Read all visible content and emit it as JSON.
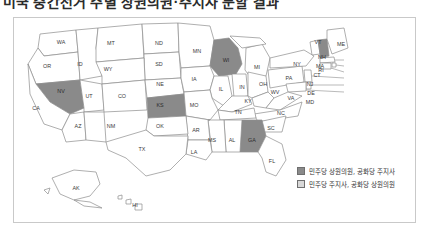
{
  "title": "미국 중간선거 주별 상원의원·주지사 분할 결과",
  "figure": {
    "legend": {
      "items": [
        {
          "label": "민주당 상원의원, 공화당 주지사",
          "swatch": "dark",
          "color": "#8a8a8a"
        },
        {
          "label": "민주당 주지사, 공화당 상원의원",
          "swatch": "light",
          "color": "#d8d8d8"
        }
      ]
    },
    "map": {
      "type": "choropleth",
      "region": "United States",
      "highlight_color": "#8a8a8a",
      "default_color": "#ffffff",
      "border_color": "#8c8c8c",
      "highlighted_states": [
        "NH",
        "WI",
        "KS",
        "NV",
        "GA"
      ],
      "state_labels": [
        {
          "code": "WA",
          "x": 47,
          "y": 26
        },
        {
          "code": "OR",
          "x": 33,
          "y": 50
        },
        {
          "code": "ID",
          "x": 66,
          "y": 48
        },
        {
          "code": "MT",
          "x": 97,
          "y": 27
        },
        {
          "code": "ND",
          "x": 145,
          "y": 27
        },
        {
          "code": "SD",
          "x": 145,
          "y": 48
        },
        {
          "code": "MN",
          "x": 183,
          "y": 35
        },
        {
          "code": "WI",
          "x": 212,
          "y": 44
        },
        {
          "code": "MI",
          "x": 243,
          "y": 51
        },
        {
          "code": "NY",
          "x": 283,
          "y": 48
        },
        {
          "code": "VT",
          "x": 304,
          "y": 26
        },
        {
          "code": "ME",
          "x": 327,
          "y": 28
        },
        {
          "code": "NH",
          "x": 308,
          "y": 41
        },
        {
          "code": "WY",
          "x": 94,
          "y": 53
        },
        {
          "code": "NV",
          "x": 47,
          "y": 75
        },
        {
          "code": "UT",
          "x": 75,
          "y": 80
        },
        {
          "code": "CO",
          "x": 108,
          "y": 80
        },
        {
          "code": "NE",
          "x": 146,
          "y": 68
        },
        {
          "code": "IA",
          "x": 180,
          "y": 63
        },
        {
          "code": "IL",
          "x": 207,
          "y": 73
        },
        {
          "code": "IN",
          "x": 228,
          "y": 71
        },
        {
          "code": "OH",
          "x": 249,
          "y": 68
        },
        {
          "code": "PA",
          "x": 275,
          "y": 62
        },
        {
          "code": "CA",
          "x": 22,
          "y": 92
        },
        {
          "code": "AZ",
          "x": 64,
          "y": 110
        },
        {
          "code": "NM",
          "x": 97,
          "y": 110
        },
        {
          "code": "KS",
          "x": 146,
          "y": 89
        },
        {
          "code": "MO",
          "x": 180,
          "y": 89
        },
        {
          "code": "KY",
          "x": 234,
          "y": 85
        },
        {
          "code": "WV",
          "x": 261,
          "y": 76
        },
        {
          "code": "VA",
          "x": 277,
          "y": 82
        },
        {
          "code": "MD",
          "x": 296,
          "y": 86
        },
        {
          "code": "DE",
          "x": 297,
          "y": 77
        },
        {
          "code": "NJ",
          "x": 296,
          "y": 68
        },
        {
          "code": "CT",
          "x": 303,
          "y": 59
        },
        {
          "code": "RI",
          "x": 307,
          "y": 54
        },
        {
          "code": "MA",
          "x": 306,
          "y": 50
        },
        {
          "code": "OK",
          "x": 146,
          "y": 110
        },
        {
          "code": "AR",
          "x": 182,
          "y": 114
        },
        {
          "code": "TN",
          "x": 224,
          "y": 96
        },
        {
          "code": "NC",
          "x": 267,
          "y": 97
        },
        {
          "code": "SC",
          "x": 257,
          "y": 112
        },
        {
          "code": "GA",
          "x": 238,
          "y": 124
        },
        {
          "code": "AL",
          "x": 218,
          "y": 124
        },
        {
          "code": "MS",
          "x": 198,
          "y": 124
        },
        {
          "code": "LA",
          "x": 180,
          "y": 136
        },
        {
          "code": "TX",
          "x": 128,
          "y": 133
        },
        {
          "code": "FL",
          "x": 258,
          "y": 145
        },
        {
          "code": "AK",
          "x": 62,
          "y": 172
        },
        {
          "code": "HI",
          "x": 121,
          "y": 189
        }
      ]
    }
  }
}
